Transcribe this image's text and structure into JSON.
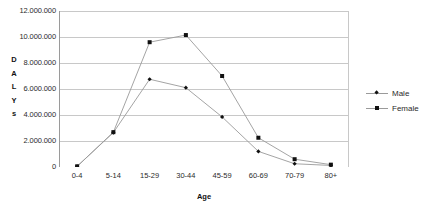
{
  "chart_data": {
    "type": "line",
    "title": "",
    "xlabel": "Age",
    "ylabel": "DALYs",
    "ylabel_letters": [
      "D",
      "A",
      "L",
      "Y",
      "s"
    ],
    "categories": [
      "0-4",
      "5-14",
      "15-29",
      "30-44",
      "45-59",
      "60-69",
      "70-79",
      "80+"
    ],
    "ylim": [
      0,
      12000000
    ],
    "ytick_values": [
      12000000,
      10000000,
      8000000,
      6000000,
      4000000,
      2000000,
      0
    ],
    "ytick_labels": [
      "12.000.000",
      "10.000.000",
      "8.000.000",
      "6.000.000",
      "4.000.000",
      "2.000.000",
      "0"
    ],
    "grid": true,
    "legend_position": "right",
    "series": [
      {
        "name": "Male",
        "marker": "diamond",
        "color": "#111111",
        "line_color": "#9a9a9a",
        "values": [
          50000,
          2650000,
          6750000,
          6100000,
          3850000,
          1200000,
          250000,
          120000
        ]
      },
      {
        "name": "Female",
        "marker": "square",
        "color": "#111111",
        "line_color": "#9a9a9a",
        "values": [
          50000,
          2680000,
          9600000,
          10150000,
          7000000,
          2250000,
          600000,
          180000
        ]
      }
    ]
  },
  "legend": {
    "items": [
      {
        "label": "Male"
      },
      {
        "label": "Female"
      }
    ]
  },
  "colors": {
    "gridline": "#c8c8c8",
    "axis": "#9a9a9a",
    "series_line": "#9a9a9a",
    "marker": "#111111",
    "text": "#2b2b2b",
    "background": "#ffffff"
  }
}
